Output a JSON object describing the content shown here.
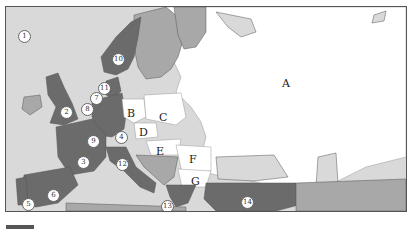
{
  "map": {
    "title": "Map of Europe",
    "colors": {
      "sea": "#d9d9d9",
      "member": "#6b6b6b",
      "non_member": "#a8a8a8",
      "candidate": "#ffffff",
      "lake": "#d9d9d9",
      "border": "#555555"
    },
    "numbered_markers": [
      {
        "label": "1",
        "x": 17,
        "y": 29
      },
      {
        "label": "2",
        "x": 59,
        "y": 105
      },
      {
        "label": "3",
        "x": 76,
        "y": 155
      },
      {
        "label": "4",
        "x": 114,
        "y": 130
      },
      {
        "label": "5",
        "x": 21,
        "y": 197
      },
      {
        "label": "6",
        "x": 46,
        "y": 188
      },
      {
        "label": "7",
        "x": 89,
        "y": 91
      },
      {
        "label": "8",
        "x": 80,
        "y": 102
      },
      {
        "label": "9",
        "x": 86,
        "y": 134
      },
      {
        "label": "10",
        "x": 111,
        "y": 52
      },
      {
        "label": "11",
        "x": 97,
        "y": 81
      },
      {
        "label": "12",
        "x": 115,
        "y": 157
      },
      {
        "label": "13",
        "x": 160,
        "y": 205
      },
      {
        "label": "14",
        "x": 240,
        "y": 197
      }
    ],
    "letter_labels": [
      {
        "label": "A",
        "x": 281,
        "y": 76
      },
      {
        "label": "B",
        "x": 126,
        "y": 106
      },
      {
        "label": "C",
        "x": 158,
        "y": 110
      },
      {
        "label": "D",
        "x": 138,
        "y": 125
      },
      {
        "label": "E",
        "x": 155,
        "y": 144
      },
      {
        "label": "F",
        "x": 188,
        "y": 152
      },
      {
        "label": "G",
        "x": 190,
        "y": 174
      }
    ]
  }
}
